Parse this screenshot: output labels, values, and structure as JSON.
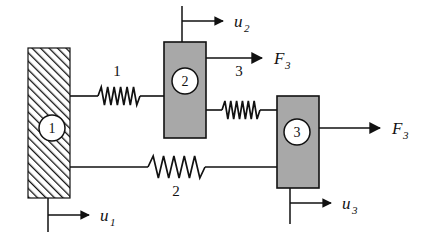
{
  "figure": {
    "type": "spring-mass-system-diagram",
    "canvas": {
      "width": 424,
      "height": 241,
      "background": "#ffffff"
    }
  },
  "colors": {
    "stroke": "#111111",
    "block_fill": "#a8a8a8",
    "wall_hatch": "#111111",
    "background": "#ffffff",
    "node_fill": "#ffffff"
  },
  "wall": {
    "name": "fixed-support-wall",
    "label": "",
    "x": 28,
    "y": 48,
    "width": 42,
    "height": 150,
    "hatch_direction": "forward-slash"
  },
  "nodes": [
    {
      "id": "node-1",
      "label": "1",
      "cx": 52,
      "cy": 128,
      "r": 13,
      "on": "wall"
    },
    {
      "id": "node-2",
      "label": "2",
      "cx": 185,
      "cy": 81,
      "r": 13,
      "on": "block-2"
    },
    {
      "id": "node-3",
      "label": "3",
      "cx": 297,
      "cy": 132,
      "r": 13,
      "on": "block-3"
    }
  ],
  "blocks": [
    {
      "id": "block-2",
      "name": "mass-block-2",
      "x": 164,
      "y": 42,
      "width": 42,
      "height": 96
    },
    {
      "id": "block-3",
      "name": "mass-block-3",
      "x": 277,
      "y": 96,
      "width": 42,
      "height": 92
    }
  ],
  "springs": [
    {
      "id": "spring-1",
      "label": "1",
      "label_position": "above",
      "label_x": 117,
      "label_y": 74,
      "x1": 70,
      "x2": 164,
      "y": 96,
      "coil_start": 98,
      "coil_end": 140,
      "coils": 6,
      "amplitude": 9,
      "style": "compact"
    },
    {
      "id": "spring-2",
      "label": "2",
      "label_position": "below",
      "label_x": 175,
      "label_y": 192,
      "x1": 70,
      "x2": 277,
      "y": 167,
      "coil_start": 148,
      "coil_end": 205,
      "coils": 5,
      "amplitude": 11,
      "style": "wide"
    },
    {
      "id": "spring-3",
      "label": "3",
      "label_position": "above",
      "label_x": 238,
      "label_y": 74,
      "x1": 206,
      "x2": 277,
      "y": 110,
      "coil_start": 222,
      "coil_end": 260,
      "coils": 6,
      "amplitude": 9,
      "style": "compact"
    }
  ],
  "forces": [
    {
      "id": "force-3-upper",
      "symbol": "F",
      "subscript": "3",
      "label": "F3",
      "x_start": 206,
      "x_end": 265,
      "y": 58,
      "label_x": 274,
      "label_y": 63,
      "origin": "block-2-right-edge"
    },
    {
      "id": "force-3-lower",
      "symbol": "F",
      "subscript": "3",
      "label": "F3",
      "x_start": 319,
      "x_end": 383,
      "y": 128,
      "label_x": 392,
      "label_y": 133,
      "origin": "block-3-right-edge"
    }
  ],
  "displacements": [
    {
      "id": "displacement-1",
      "symbol": "u",
      "subscript": "1",
      "label": "u1",
      "tick_x": 48,
      "tick_y1": 198,
      "tick_y2": 232,
      "arrow_y": 215,
      "arrow_x_end": 92,
      "label_x": 101,
      "label_y": 221,
      "attached_to": "wall-bottom"
    },
    {
      "id": "displacement-2",
      "symbol": "u",
      "subscript": "2",
      "label": "u2",
      "tick_x": 182,
      "tick_y1": 6,
      "tick_y2": 42,
      "arrow_y": 21,
      "arrow_x_end": 226,
      "label_x": 235,
      "label_y": 27,
      "attached_to": "block-2-top"
    },
    {
      "id": "displacement-3",
      "symbol": "u",
      "subscript": "3",
      "label": "u3",
      "tick_x": 290,
      "tick_y1": 188,
      "tick_y2": 224,
      "arrow_y": 203,
      "arrow_x_end": 334,
      "label_x": 343,
      "label_y": 209,
      "attached_to": "block-3-bottom"
    }
  ],
  "connectors": [
    {
      "id": "wall-to-spring1",
      "name": "link-node1-spring1",
      "x1": 70,
      "y1": 96,
      "x2": 98,
      "y2": 96
    },
    {
      "id": "spring1-to-block2",
      "name": "link-spring1-block2",
      "x1": 140,
      "y1": 96,
      "x2": 164,
      "y2": 96
    },
    {
      "id": "block2-to-spring3",
      "name": "link-block2-spring3",
      "x1": 206,
      "y1": 110,
      "x2": 222,
      "y2": 110
    },
    {
      "id": "spring3-to-block3",
      "name": "link-spring3-block3",
      "x1": 260,
      "y1": 110,
      "x2": 277,
      "y2": 110
    },
    {
      "id": "wall-to-spring2",
      "name": "link-node1-spring2",
      "x1": 70,
      "y1": 167,
      "x2": 148,
      "y2": 167
    },
    {
      "id": "spring2-to-block3",
      "name": "link-spring2-block3",
      "x1": 205,
      "y1": 167,
      "x2": 277,
      "y2": 167
    }
  ]
}
